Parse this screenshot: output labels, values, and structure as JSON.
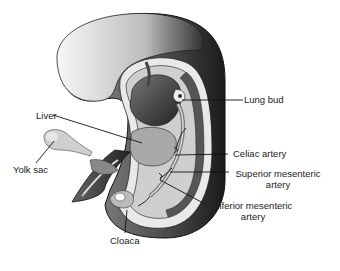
{
  "figure": {
    "signature": "ah-K",
    "labels": {
      "lung_bud": "Lung bud",
      "liver": "Liver",
      "yolk_sac": "Yolk sac",
      "celiac_artery": "Celiac artery",
      "superior_mesenteric_1": "Superior mesenteric",
      "superior_mesenteric_2": "artery",
      "inferior_mesenteric_1": "Inferior mesenteric",
      "inferior_mesenteric_2": "artery",
      "cloaca": "Cloaca"
    }
  }
}
